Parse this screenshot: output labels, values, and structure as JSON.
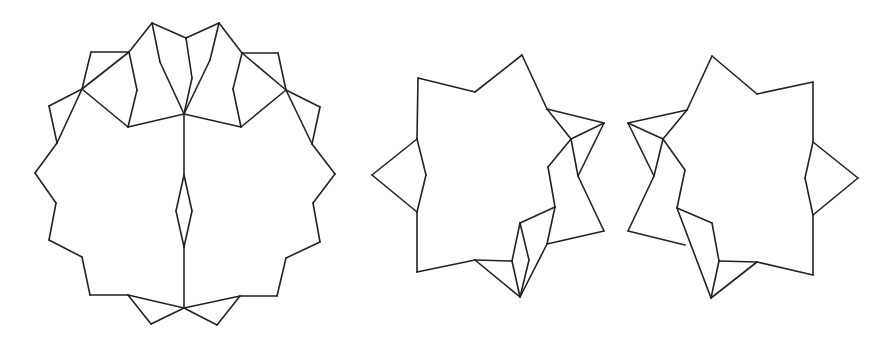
{
  "diagram": {
    "stroke_color": "#222222",
    "background": "#ffffff",
    "figures": [
      {
        "name": "twelve-point-star-folded",
        "segments": [
          [
            [
              152,
              23
            ],
            [
              186,
              38
            ]
          ],
          [
            [
              186,
              38
            ],
            [
              219,
              23
            ]
          ],
          [
            [
              152,
              23
            ],
            [
              129,
              52
            ]
          ],
          [
            [
              219,
              23
            ],
            [
              242,
              53
            ]
          ],
          [
            [
              129,
              52
            ],
            [
              91,
              52
            ]
          ],
          [
            [
              91,
              52
            ],
            [
              82,
              89
            ]
          ],
          [
            [
              242,
              53
            ],
            [
              278,
              53
            ]
          ],
          [
            [
              278,
              53
            ],
            [
              286,
              90
            ]
          ],
          [
            [
              129,
              52
            ],
            [
              82,
              89
            ]
          ],
          [
            [
              242,
              53
            ],
            [
              286,
              90
            ]
          ],
          [
            [
              82,
              89
            ],
            [
              49,
              106
            ]
          ],
          [
            [
              49,
              106
            ],
            [
              57,
              143
            ]
          ],
          [
            [
              286,
              90
            ],
            [
              320,
              107
            ]
          ],
          [
            [
              320,
              107
            ],
            [
              312,
              144
            ]
          ],
          [
            [
              82,
              89
            ],
            [
              57,
              143
            ]
          ],
          [
            [
              286,
              90
            ],
            [
              312,
              144
            ]
          ],
          [
            [
              57,
              143
            ],
            [
              35,
              173
            ]
          ],
          [
            [
              35,
              173
            ],
            [
              56,
              203
            ]
          ],
          [
            [
              56,
              203
            ],
            [
              49,
              240
            ]
          ],
          [
            [
              49,
              240
            ],
            [
              82,
              257
            ]
          ],
          [
            [
              82,
              257
            ],
            [
              90,
              295
            ]
          ],
          [
            [
              90,
              295
            ],
            [
              128,
              295
            ]
          ],
          [
            [
              312,
              144
            ],
            [
              335,
              174
            ]
          ],
          [
            [
              335,
              174
            ],
            [
              313,
              203
            ]
          ],
          [
            [
              313,
              203
            ],
            [
              320,
              242
            ]
          ],
          [
            [
              320,
              242
            ],
            [
              286,
              258
            ]
          ],
          [
            [
              286,
              258
            ],
            [
              277,
              296
            ]
          ],
          [
            [
              277,
              296
            ],
            [
              240,
              296
            ]
          ],
          [
            [
              128,
              295
            ],
            [
              151,
              324
            ]
          ],
          [
            [
              151,
              324
            ],
            [
              184,
              308
            ]
          ],
          [
            [
              184,
              308
            ],
            [
              128,
              295
            ]
          ],
          [
            [
              240,
              296
            ],
            [
              217,
              325
            ]
          ],
          [
            [
              217,
              325
            ],
            [
              184,
              308
            ]
          ],
          [
            [
              184,
              308
            ],
            [
              240,
              296
            ]
          ],
          [
            [
              82,
              89
            ],
            [
              128,
              127
            ]
          ],
          [
            [
              128,
              127
            ],
            [
              184,
              114
            ]
          ],
          [
            [
              184,
              114
            ],
            [
              241,
              127
            ]
          ],
          [
            [
              241,
              127
            ],
            [
              286,
              90
            ]
          ],
          [
            [
              129,
              52
            ],
            [
              137,
              90
            ]
          ],
          [
            [
              137,
              90
            ],
            [
              128,
              127
            ]
          ],
          [
            [
              242,
              53
            ],
            [
              233,
              89
            ]
          ],
          [
            [
              233,
              89
            ],
            [
              241,
              127
            ]
          ],
          [
            [
              152,
              23
            ],
            [
              160,
              62
            ]
          ],
          [
            [
              160,
              62
            ],
            [
              184,
              114
            ]
          ],
          [
            [
              186,
              38
            ],
            [
              192,
              78
            ]
          ],
          [
            [
              192,
              78
            ],
            [
              184,
              114
            ]
          ],
          [
            [
              219,
              23
            ],
            [
              210,
              60
            ]
          ],
          [
            [
              210,
              60
            ],
            [
              184,
              114
            ]
          ],
          [
            [
              184,
              114
            ],
            [
              184,
              175
            ]
          ],
          [
            [
              184,
              175
            ],
            [
              176,
              211
            ]
          ],
          [
            [
              176,
              211
            ],
            [
              184,
              247
            ]
          ],
          [
            [
              184,
              247
            ],
            [
              192,
              211
            ]
          ],
          [
            [
              192,
              211
            ],
            [
              184,
              175
            ]
          ],
          [
            [
              184,
              247
            ],
            [
              184,
              308
            ]
          ]
        ]
      },
      {
        "name": "seven-point-star-left-variant",
        "segments": [
          [
            [
              418,
              78
            ],
            [
              475,
              92
            ]
          ],
          [
            [
              475,
              92
            ],
            [
              522,
              55
            ]
          ],
          [
            [
              522,
              55
            ],
            [
              547,
              109
            ]
          ],
          [
            [
              547,
              109
            ],
            [
              571,
              139
            ]
          ],
          [
            [
              547,
              109
            ],
            [
              604,
              123
            ]
          ],
          [
            [
              604,
              123
            ],
            [
              571,
              139
            ]
          ],
          [
            [
              604,
              123
            ],
            [
              578,
              176
            ]
          ],
          [
            [
              571,
              139
            ],
            [
              548,
              167
            ]
          ],
          [
            [
              571,
              139
            ],
            [
              578,
              176
            ]
          ],
          [
            [
              578,
              176
            ],
            [
              604,
              231
            ]
          ],
          [
            [
              604,
              231
            ],
            [
              547,
              244
            ]
          ],
          [
            [
              548,
              167
            ],
            [
              555,
              207
            ]
          ],
          [
            [
              555,
              207
            ],
            [
              547,
              244
            ]
          ],
          [
            [
              555,
              207
            ],
            [
              520,
              223
            ]
          ],
          [
            [
              520,
              223
            ],
            [
              512,
              261
            ]
          ],
          [
            [
              520,
              223
            ],
            [
              529,
              260
            ]
          ],
          [
            [
              547,
              244
            ],
            [
              520,
              297
            ]
          ],
          [
            [
              529,
              260
            ],
            [
              520,
              297
            ]
          ],
          [
            [
              512,
              261
            ],
            [
              520,
              297
            ]
          ],
          [
            [
              475,
              260
            ],
            [
              512,
              261
            ]
          ],
          [
            [
              475,
              260
            ],
            [
              520,
              297
            ]
          ],
          [
            [
              475,
              260
            ],
            [
              417,
              272
            ]
          ],
          [
            [
              417,
              272
            ],
            [
              417,
              212
            ]
          ],
          [
            [
              417,
              212
            ],
            [
              372,
              175
            ]
          ],
          [
            [
              372,
              175
            ],
            [
              417,
              139
            ]
          ],
          [
            [
              417,
              212
            ],
            [
              426,
              175
            ]
          ],
          [
            [
              426,
              175
            ],
            [
              417,
              139
            ]
          ],
          [
            [
              417,
              139
            ],
            [
              418,
              78
            ]
          ]
        ]
      },
      {
        "name": "seven-point-star-right-variant",
        "segments": [
          [
            [
              712,
              56
            ],
            [
              757,
              94
            ]
          ],
          [
            [
              757,
              94
            ],
            [
              813,
              82
            ]
          ],
          [
            [
              813,
              82
            ],
            [
              813,
              142
            ]
          ],
          [
            [
              813,
              142
            ],
            [
              858,
              178
            ]
          ],
          [
            [
              858,
              178
            ],
            [
              813,
              215
            ]
          ],
          [
            [
              813,
              142
            ],
            [
              805,
              178
            ]
          ],
          [
            [
              805,
              178
            ],
            [
              813,
              215
            ]
          ],
          [
            [
              813,
              215
            ],
            [
              813,
              275
            ]
          ],
          [
            [
              813,
              275
            ],
            [
              757,
              262
            ]
          ],
          [
            [
              757,
              262
            ],
            [
              711,
              298
            ]
          ],
          [
            [
              757,
              262
            ],
            [
              719,
              261
            ]
          ],
          [
            [
              719,
              261
            ],
            [
              711,
              298
            ]
          ],
          [
            [
              719,
              261
            ],
            [
              712,
              223
            ]
          ],
          [
            [
              712,
              223
            ],
            [
              677,
              208
            ]
          ],
          [
            [
              677,
              208
            ],
            [
              685,
              170
            ]
          ],
          [
            [
              685,
              170
            ],
            [
              663,
              139
            ]
          ],
          [
            [
              677,
              208
            ],
            [
              711,
              298
            ]
          ],
          [
            [
              712,
              56
            ],
            [
              687,
              110
            ]
          ],
          [
            [
              687,
              110
            ],
            [
              663,
              139
            ]
          ],
          [
            [
              628,
              123
            ],
            [
              687,
              110
            ]
          ],
          [
            [
              628,
              123
            ],
            [
              663,
              139
            ]
          ],
          [
            [
              628,
              123
            ],
            [
              654,
              176
            ]
          ],
          [
            [
              663,
              139
            ],
            [
              654,
              176
            ]
          ],
          [
            [
              654,
              176
            ],
            [
              628,
              231
            ]
          ],
          [
            [
              628,
              231
            ],
            [
              685,
              245
            ]
          ]
        ]
      }
    ]
  }
}
